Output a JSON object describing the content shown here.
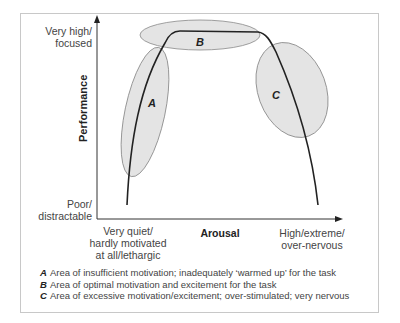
{
  "diagram": {
    "type": "inverted-U performance-arousal curve",
    "y_axis": {
      "title": "Performance",
      "top_label": "Very high/\nfocused",
      "bottom_label": "Poor/\ndistractable"
    },
    "x_axis": {
      "title": "Arousal",
      "left_label": "Very quiet/\nhardly motivated\nat all/lethargic",
      "right_label": "High/extreme/\nover-nervous"
    },
    "regions": [
      {
        "key": "A",
        "description": "Area of insufficient motivation; inadequately ‘warmed up’ for the task"
      },
      {
        "key": "B",
        "description": "Area of optimal motivation and excitement for the task"
      },
      {
        "key": "C",
        "description": "Area of excessive motivation/excitement; over-stimulated; very nervous"
      }
    ],
    "colors": {
      "region_fill": "#e4e4e4",
      "region_stroke": "#888888",
      "curve": "#222222",
      "frame": "#c8c8c8"
    }
  }
}
